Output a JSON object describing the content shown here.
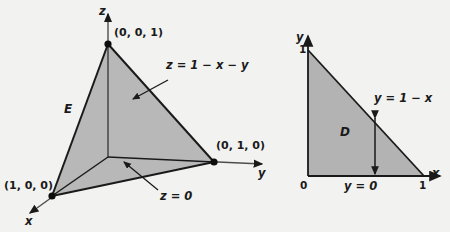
{
  "figure": {
    "background_color": "#f2f2f0",
    "fill_color": "#b3b3b3",
    "stroke_color": "#1a1a1a"
  },
  "left_diagram": {
    "name": "tetrahedron-3d",
    "axes": [
      {
        "id": "z",
        "label": "z"
      },
      {
        "id": "y",
        "label": "y"
      },
      {
        "id": "x",
        "label": "x"
      }
    ],
    "vertices": [
      {
        "id": "apex",
        "label": "(0, 0, 1)"
      },
      {
        "id": "y-vertex",
        "label": "(0, 1, 0)"
      },
      {
        "id": "x-vertex",
        "label": "(1, 0, 0)"
      }
    ],
    "region_label": "E",
    "surface_labels": [
      {
        "id": "top-plane",
        "label": "z = 1 − x − y"
      },
      {
        "id": "bottom-plane",
        "label": "z = 0"
      }
    ]
  },
  "right_diagram": {
    "name": "triangle-2d",
    "axes": [
      {
        "id": "y",
        "label": "y"
      },
      {
        "id": "x",
        "label": "x"
      }
    ],
    "ticks": [
      {
        "id": "y-one",
        "label": "1"
      },
      {
        "id": "origin",
        "label": "0"
      },
      {
        "id": "x-one",
        "label": "1"
      }
    ],
    "region_label": "D",
    "boundary_labels": [
      {
        "id": "hypotenuse",
        "label": "y = 1 − x"
      },
      {
        "id": "base",
        "label": "y = 0"
      }
    ]
  }
}
